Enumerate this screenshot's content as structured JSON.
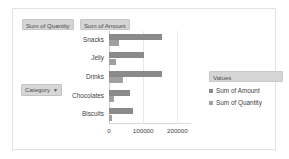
{
  "field_buttons": [
    {
      "name": "sum-of-quantity",
      "label": "Sum of Quantity"
    },
    {
      "name": "sum-of-amount",
      "label": "Sum of Amount"
    }
  ],
  "category_filter": {
    "label": "Category",
    "caret": "▼"
  },
  "legend": {
    "title": "Values",
    "items": [
      {
        "label": "Sum of Amount",
        "color": "#8a8a8a"
      },
      {
        "label": "Sum of Quantity",
        "color": "#a0a0a0"
      }
    ]
  },
  "colors": {
    "amount": "#8a8a8a",
    "quantity": "#a0a0a0",
    "gridline": "#e8e8e8",
    "frame": "#e2e2e2",
    "button": "#d5d5d5",
    "text": "#3f3f3f"
  },
  "chart_data": {
    "type": "bar",
    "orientation": "horizontal",
    "title": "",
    "xlabel": "",
    "ylabel": "",
    "categories": [
      "Snacks",
      "Jelly",
      "Drinks",
      "Chocolates",
      "Biscuits"
    ],
    "series": [
      {
        "name": "Sum of Amount",
        "color": "#8a8a8a",
        "values": [
          155000,
          103000,
          155000,
          60000,
          70000
        ]
      },
      {
        "name": "Sum of Quantity",
        "color": "#a0a0a0",
        "values": [
          28000,
          20000,
          40000,
          16000,
          8000
        ]
      }
    ],
    "xlim": [
      0,
      240000
    ],
    "xticks": [
      0,
      100000,
      200000
    ],
    "xtick_labels": [
      "0",
      "100000",
      "200000"
    ],
    "grid": true,
    "legend_position": "right"
  }
}
